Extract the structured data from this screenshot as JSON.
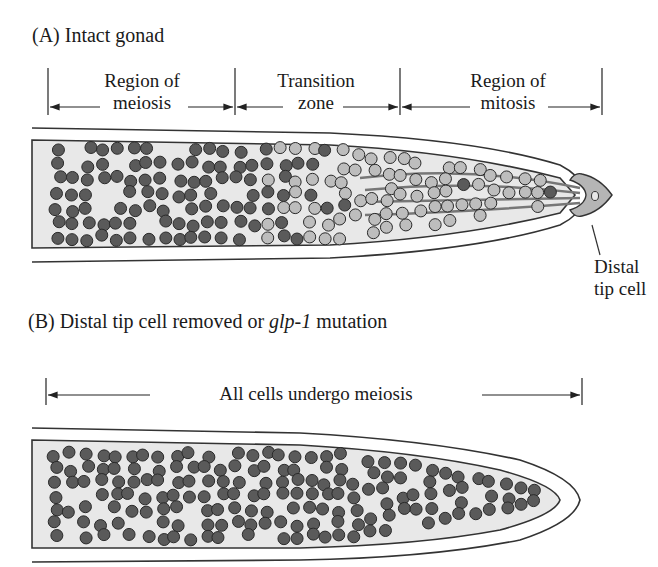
{
  "panel_a": {
    "title": "(A) Intact gonad",
    "regions": [
      {
        "line1": "Region of",
        "line2": "meiosis"
      },
      {
        "line1": "Transition",
        "line2": "zone"
      },
      {
        "line1": "Region of",
        "line2": "mitosis"
      }
    ],
    "callout": {
      "line1": "Distal",
      "line2": "tip cell"
    }
  },
  "panel_b": {
    "title_prefix": "(B) Distal tip cell removed or ",
    "title_gene": "glp-1",
    "title_suffix": " mutation",
    "span_label": "All cells undergo meiosis"
  },
  "colors": {
    "meiotic_cell": "#5a5a5a",
    "mitotic_cell": "#bdbdbd",
    "gonad_fill": "#e8e8e8",
    "tip_cell": "#b5b5b5",
    "outline": "#333333"
  }
}
